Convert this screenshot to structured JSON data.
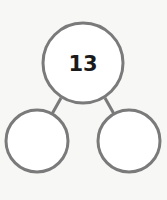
{
  "diagram": {
    "type": "number-bond",
    "whole": {
      "value": "13"
    },
    "parts": [
      {
        "value": ""
      },
      {
        "value": ""
      }
    ],
    "colors": {
      "stroke": "#7a7a7a",
      "text": "#1a1a1a",
      "background": "#f7f7f5"
    }
  }
}
